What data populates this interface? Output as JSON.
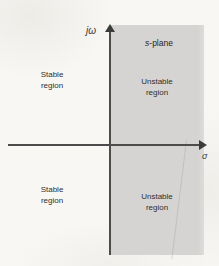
{
  "figure": {
    "plane_label": "s-plane",
    "background_color": "#f8f7f4",
    "shaded_region_color": "#d5d4d2",
    "axis_color": "#4c4c4c"
  },
  "axes": {
    "imaginary": {
      "label": "jω",
      "direction": "up",
      "arrow": "arrow-up"
    },
    "real": {
      "label": "σ",
      "direction": "right",
      "arrow": "arrow-right"
    }
  },
  "regions": [
    {
      "name": "stable-upper-left",
      "line1": "Stable",
      "line2": "region",
      "shaded": false,
      "quadrant": "upper-left"
    },
    {
      "name": "unstable-upper-right",
      "line1": "Unstable",
      "line2": "region",
      "shaded": true,
      "quadrant": "upper-right"
    },
    {
      "name": "stable-lower-left",
      "line1": "Stable",
      "line2": "region",
      "shaded": false,
      "quadrant": "lower-left"
    },
    {
      "name": "unstable-lower-right",
      "line1": "Unstable",
      "line2": "region",
      "shaded": true,
      "quadrant": "lower-right"
    }
  ]
}
